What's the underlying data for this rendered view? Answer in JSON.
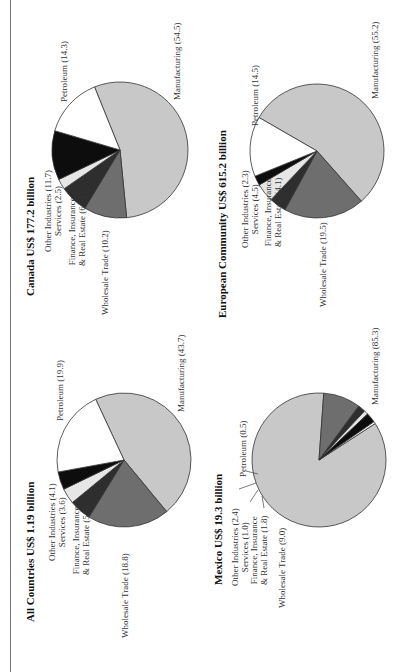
{
  "chart_data": [
    {
      "type": "pie",
      "title": "All Countries US$ 1.19 billion",
      "categories": [
        "Manufacturing",
        "Wholesale Trade",
        "Finance, Insurance & Real Estate",
        "Services",
        "Other Industries",
        "Petroleum"
      ],
      "values": [
        43.7,
        18.8,
        5.0,
        3.6,
        4.1,
        19.9
      ],
      "labels": {
        "manufacturing": "Manufacturing (43.7)",
        "wholesale": "Wholesale Trade (18.8)",
        "finance1": "Finance, Insurance",
        "finance2": "& Real Estate (5.0)",
        "services": "Services (3.6)",
        "other": "Other Industries (4.1)",
        "petroleum": "Petroleum (19.9)"
      }
    },
    {
      "type": "pie",
      "title": "Mexico US$ 19.3 billion",
      "categories": [
        "Manufacturing",
        "Wholesale Trade",
        "Finance, Insurance & Real Estate",
        "Services",
        "Other Industries",
        "Petroleum"
      ],
      "values": [
        85.3,
        9.0,
        1.8,
        1.0,
        2.4,
        0.5
      ],
      "labels": {
        "manufacturing": "Manufacturing (85.3)",
        "wholesale": "Wholesale Trade (9.0)",
        "finance1": "Finance, Insurance",
        "finance2": "& Real Estate (1.8)",
        "services": "Services (1.0)",
        "other": "Other Industries (2.4)",
        "petroleum": "Petroleum (0.5)"
      }
    },
    {
      "type": "pie",
      "title": "Canada US$ 177.2 billion",
      "categories": [
        "Manufacturing",
        "Wholesale Trade",
        "Finance, Insurance & Real Estate",
        "Services",
        "Other Industries",
        "Petroleum"
      ],
      "values": [
        54.5,
        10.2,
        6.7,
        2.5,
        11.7,
        14.3
      ],
      "labels": {
        "manufacturing": "Manufacturing (54.5)",
        "wholesale": "Wholesale Trade (10.2)",
        "finance1": "Finance, Insurance",
        "finance2": "& Real Estate (6.7)",
        "services": "Services (2.5)",
        "other": "Other Industries (11.7)",
        "petroleum": "Petroleum (14.3)"
      }
    },
    {
      "type": "pie",
      "title": "European Community US$ 615.2 billion",
      "categories": [
        "Manufacturing",
        "Wholesale Trade",
        "Finance, Insurance & Real Estate",
        "Services",
        "Other Industries",
        "Petroleum"
      ],
      "values": [
        55.2,
        19.5,
        4.1,
        4.5,
        2.3,
        14.5
      ],
      "labels": {
        "manufacturing": "Manufacturing (55.2)",
        "wholesale": "Wholesale Trade (19.5)",
        "finance1": "Finance, Insurance",
        "finance2": "& Real Estate (4.1)",
        "services": "Services (4.5)",
        "other": "Other Industries (2.3)",
        "petroleum": "Petroleum (14.5)"
      }
    }
  ],
  "colors": {
    "manufacturing": "#c8c8c8",
    "wholesale": "#6e6e6e",
    "finance": "#2e2e2e",
    "services": "#e6e6e6",
    "other": "#0d0d0d",
    "petroleum": "#ffffff",
    "outline": "#333333"
  }
}
